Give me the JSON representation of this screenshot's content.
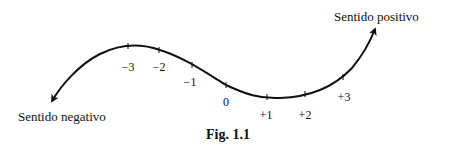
{
  "diagram": {
    "title": "Fig. 1.1",
    "negative_label": "Sentido negativo",
    "positive_label": "Sentido positivo",
    "ticks": [
      {
        "label": "−3",
        "value": -3
      },
      {
        "label": "−2",
        "value": -2
      },
      {
        "label": "−1",
        "value": -1
      },
      {
        "label": "0",
        "value": 0
      },
      {
        "label": "+1",
        "value": 1
      },
      {
        "label": "+2",
        "value": 2
      },
      {
        "label": "+3",
        "value": 3
      }
    ]
  }
}
